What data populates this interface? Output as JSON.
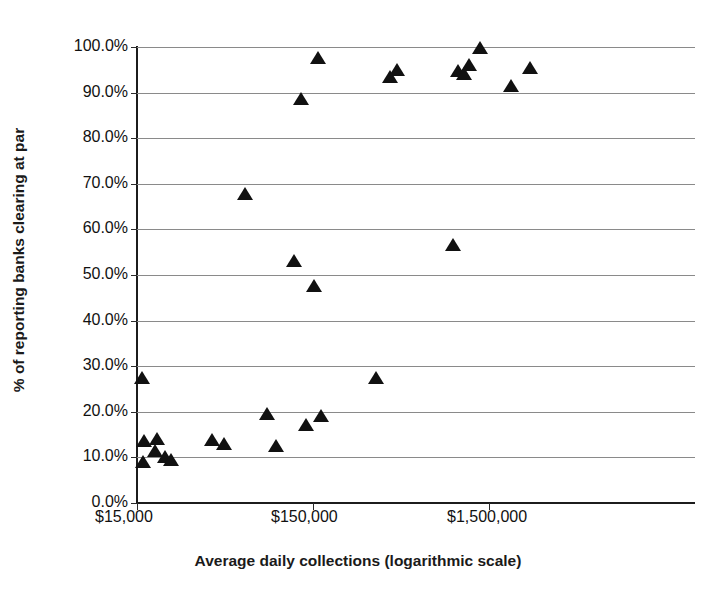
{
  "chart_data": {
    "type": "scatter",
    "title": "",
    "xlabel": "Average daily collections (logarithmic scale)",
    "ylabel": "% of reporting banks clearing at par",
    "xscale": "log",
    "xlim": [
      15000,
      3000000
    ],
    "ylim": [
      0,
      100
    ],
    "grid": true,
    "legend": null,
    "marker": "triangle",
    "marker_color": "#111111",
    "xticks": [
      {
        "value": 15000,
        "label": "$15,000"
      },
      {
        "value": 150000,
        "label": "$150,000"
      },
      {
        "value": 1500000,
        "label": "$1,500,000"
      }
    ],
    "yticks": [
      {
        "value": 0,
        "label": "0.0%"
      },
      {
        "value": 10,
        "label": "10.0%"
      },
      {
        "value": 20,
        "label": "20.0%"
      },
      {
        "value": 30,
        "label": "30.0%"
      },
      {
        "value": 40,
        "label": "40.0%"
      },
      {
        "value": 50,
        "label": "50.0%"
      },
      {
        "value": 60,
        "label": "60.0%"
      },
      {
        "value": 70,
        "label": "70.0%"
      },
      {
        "value": 80,
        "label": "80.0%"
      },
      {
        "value": 90,
        "label": "90.0%"
      },
      {
        "value": 100,
        "label": "100.0%"
      }
    ],
    "points": [
      {
        "x": 16000,
        "y": 27.5
      },
      {
        "x": 16500,
        "y": 13.5
      },
      {
        "x": 16200,
        "y": 9.0
      },
      {
        "x": 19500,
        "y": 14.0
      },
      {
        "x": 19000,
        "y": 11.5
      },
      {
        "x": 21500,
        "y": 10.0
      },
      {
        "x": 23500,
        "y": 9.5
      },
      {
        "x": 40000,
        "y": 13.8
      },
      {
        "x": 47000,
        "y": 13.0
      },
      {
        "x": 62000,
        "y": 67.8
      },
      {
        "x": 82000,
        "y": 19.5
      },
      {
        "x": 92000,
        "y": 12.5
      },
      {
        "x": 117000,
        "y": 53.0
      },
      {
        "x": 129000,
        "y": 88.5
      },
      {
        "x": 136000,
        "y": 17.2
      },
      {
        "x": 152000,
        "y": 47.5
      },
      {
        "x": 160000,
        "y": 97.5
      },
      {
        "x": 167000,
        "y": 19.0
      },
      {
        "x": 340000,
        "y": 27.4
      },
      {
        "x": 410000,
        "y": 93.5
      },
      {
        "x": 450000,
        "y": 95.0
      },
      {
        "x": 940000,
        "y": 56.5
      },
      {
        "x": 1000000,
        "y": 94.8
      },
      {
        "x": 1080000,
        "y": 94.0
      },
      {
        "x": 1150000,
        "y": 96.0
      },
      {
        "x": 1330000,
        "y": 99.8
      },
      {
        "x": 2000000,
        "y": 91.5
      },
      {
        "x": 2550000,
        "y": 95.3
      }
    ]
  }
}
